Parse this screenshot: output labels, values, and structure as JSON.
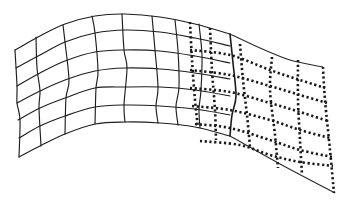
{
  "figure": {
    "colors": {
      "line": "#1e1e1e",
      "background": "#ffffff"
    },
    "solid_grid": {
      "rows": 7,
      "columns": 9,
      "horizontal_lines": [
        [
          [
            15,
            50
          ],
          [
            40,
            36
          ],
          [
            65,
            24
          ],
          [
            95,
            16
          ],
          [
            125,
            14
          ],
          [
            160,
            17
          ],
          [
            195,
            24
          ],
          [
            230,
            34
          ]
        ],
        [
          [
            16,
            68
          ],
          [
            40,
            55
          ],
          [
            65,
            42
          ],
          [
            95,
            33
          ],
          [
            125,
            30
          ],
          [
            160,
            32
          ],
          [
            195,
            38
          ],
          [
            230,
            46
          ]
        ],
        [
          [
            17,
            86
          ],
          [
            40,
            73
          ],
          [
            65,
            61
          ],
          [
            95,
            52
          ],
          [
            125,
            50
          ],
          [
            160,
            51
          ],
          [
            195,
            56
          ],
          [
            230,
            63
          ]
        ],
        [
          [
            17,
            103
          ],
          [
            40,
            91
          ],
          [
            65,
            80
          ],
          [
            95,
            71
          ],
          [
            125,
            68
          ],
          [
            160,
            69
          ],
          [
            195,
            73
          ],
          [
            230,
            79
          ]
        ],
        [
          [
            18,
            120
          ],
          [
            40,
            108
          ],
          [
            65,
            98
          ],
          [
            95,
            88
          ],
          [
            125,
            87
          ],
          [
            160,
            87
          ],
          [
            195,
            90
          ],
          [
            230,
            96
          ]
        ],
        [
          [
            19,
            138
          ],
          [
            40,
            126
          ],
          [
            65,
            116
          ],
          [
            95,
            107
          ],
          [
            125,
            105
          ],
          [
            160,
            106
          ],
          [
            195,
            109
          ],
          [
            230,
            115
          ]
        ],
        [
          [
            19,
            157
          ],
          [
            40,
            146
          ],
          [
            65,
            134
          ],
          [
            95,
            124
          ],
          [
            125,
            122
          ],
          [
            160,
            123
          ],
          [
            195,
            127
          ],
          [
            230,
            136
          ]
        ]
      ],
      "vertical_lines": [
        [
          [
            15,
            50
          ],
          [
            17,
            86
          ],
          [
            17,
            103
          ],
          [
            20,
            120
          ],
          [
            19,
            157
          ]
        ],
        [
          [
            36,
            37
          ],
          [
            37,
            68
          ],
          [
            40,
            91
          ],
          [
            39,
            108
          ],
          [
            41,
            146
          ]
        ],
        [
          [
            63,
            25
          ],
          [
            65,
            42
          ],
          [
            69,
            80
          ],
          [
            66,
            98
          ],
          [
            65,
            134
          ]
        ],
        [
          [
            92,
            16
          ],
          [
            95,
            33
          ],
          [
            98,
            71
          ],
          [
            96,
            88
          ],
          [
            95,
            124
          ]
        ],
        [
          [
            122,
            14
          ],
          [
            124,
            50
          ],
          [
            127,
            68
          ],
          [
            124,
            105
          ],
          [
            125,
            122
          ]
        ],
        [
          [
            152,
            16
          ],
          [
            155,
            50
          ],
          [
            158,
            87
          ],
          [
            156,
            106
          ],
          [
            158,
            123
          ]
        ],
        [
          [
            175,
            20
          ],
          [
            178,
            51
          ],
          [
            179,
            87
          ],
          [
            176,
            106
          ],
          [
            178,
            125
          ]
        ],
        [
          [
            199,
            24
          ],
          [
            202,
            56
          ],
          [
            201,
            90
          ],
          [
            199,
            109
          ],
          [
            200,
            128
          ]
        ]
      ],
      "thick_vertical_line": [
        [
          230,
          34
        ],
        [
          233,
          63
        ],
        [
          236,
          96
        ],
        [
          232,
          115
        ],
        [
          230,
          136
        ]
      ]
    },
    "outline": {
      "top": [
        [
          230,
          34
        ],
        [
          260,
          48
        ],
        [
          290,
          60
        ],
        [
          323,
          67
        ]
      ],
      "bottom": [
        [
          230,
          136
        ],
        [
          280,
          164
        ],
        [
          335,
          193
        ]
      ]
    },
    "dotted_grid": {
      "horizontal_lines": [
        [
          [
            190,
            50
          ],
          [
            230,
            55
          ],
          [
            270,
            70
          ],
          [
            300,
            80
          ],
          [
            325,
            88
          ]
        ],
        [
          [
            190,
            70
          ],
          [
            230,
            75
          ],
          [
            270,
            86
          ],
          [
            300,
            95
          ],
          [
            327,
            103
          ]
        ],
        [
          [
            190,
            88
          ],
          [
            230,
            92
          ],
          [
            270,
            103
          ],
          [
            300,
            112
          ],
          [
            328,
            121
          ]
        ],
        [
          [
            192,
            106
          ],
          [
            230,
            110
          ],
          [
            270,
            120
          ],
          [
            300,
            130
          ],
          [
            330,
            138
          ]
        ],
        [
          [
            195,
            124
          ],
          [
            230,
            128
          ],
          [
            270,
            140
          ],
          [
            300,
            150
          ],
          [
            332,
            157
          ]
        ],
        [
          [
            200,
            141
          ],
          [
            240,
            145
          ],
          [
            270,
            155
          ],
          [
            300,
            162
          ],
          [
            333,
            166
          ]
        ]
      ],
      "vertical_lines": [
        [
          [
            190,
            22
          ],
          [
            192,
            60
          ],
          [
            195,
            100
          ],
          [
            198,
            128
          ]
        ],
        [
          [
            210,
            28
          ],
          [
            212,
            70
          ],
          [
            215,
            110
          ],
          [
            216,
            140
          ]
        ],
        [
          [
            240,
            44
          ],
          [
            243,
            80
          ],
          [
            247,
            115
          ],
          [
            250,
            147
          ]
        ],
        [
          [
            272,
            57
          ],
          [
            270,
            90
          ],
          [
            275,
            135
          ],
          [
            278,
            168
          ]
        ],
        [
          [
            298,
            60
          ],
          [
            298,
            100
          ],
          [
            300,
            140
          ],
          [
            302,
            175
          ]
        ],
        [
          [
            323,
            67
          ],
          [
            325,
            100
          ],
          [
            330,
            150
          ],
          [
            334,
            193
          ]
        ]
      ]
    }
  }
}
